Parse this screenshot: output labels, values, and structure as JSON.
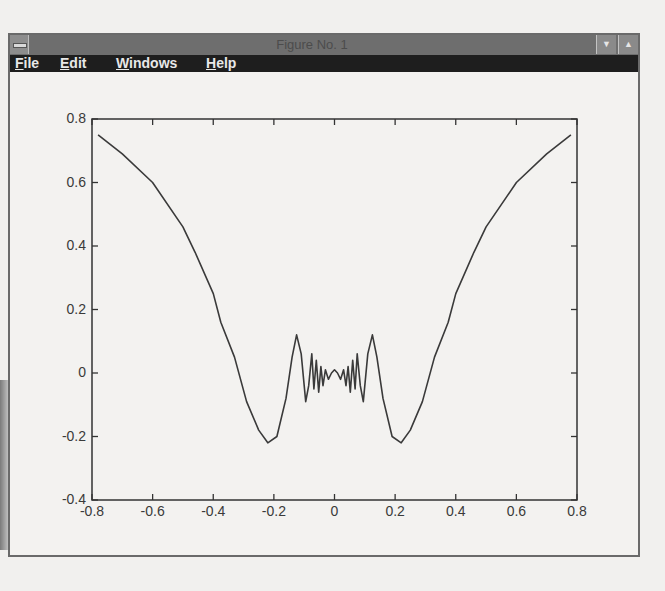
{
  "window": {
    "title": "Figure No. 1",
    "minimize_glyph": "▼",
    "maximize_glyph": "▲"
  },
  "menu": {
    "items": [
      {
        "label": "File",
        "mnemonic": "F",
        "rest": "ile"
      },
      {
        "label": "Edit",
        "mnemonic": "E",
        "rest": "dit"
      },
      {
        "label": "Windows",
        "mnemonic": "W",
        "rest": "indows"
      },
      {
        "label": "Help",
        "mnemonic": "H",
        "rest": "elp"
      }
    ]
  },
  "colors": {
    "line": "#3a3a3a",
    "axes": "#333333",
    "titlebar": "#6e6e6e",
    "menubar": "#1e1e1e"
  },
  "chart_data": {
    "type": "line",
    "title": "",
    "xlabel": "",
    "ylabel": "",
    "xlim": [
      -0.8,
      0.8
    ],
    "ylim": [
      -0.4,
      0.8
    ],
    "grid": false,
    "legend": null,
    "x_ticks": [
      "-0.8",
      "-0.6",
      "-0.4",
      "-0.2",
      "0",
      "0.2",
      "0.4",
      "0.6",
      "0.8"
    ],
    "y_ticks": [
      "-0.4",
      "-0.2",
      "0",
      "0.2",
      "0.4",
      "0.6",
      "0.8"
    ],
    "series": [
      {
        "name": "y",
        "x": [
          -0.78,
          -0.7,
          -0.6,
          -0.5,
          -0.46,
          -0.4,
          -0.375,
          -0.33,
          -0.29,
          -0.25,
          -0.22,
          -0.19,
          -0.16,
          -0.14,
          -0.125,
          -0.11,
          -0.095,
          -0.085,
          -0.075,
          -0.068,
          -0.06,
          -0.052,
          -0.045,
          -0.038,
          -0.03,
          -0.02,
          -0.01,
          0.0,
          0.01,
          0.02,
          0.03,
          0.038,
          0.045,
          0.052,
          0.06,
          0.068,
          0.075,
          0.085,
          0.095,
          0.11,
          0.125,
          0.14,
          0.16,
          0.19,
          0.22,
          0.25,
          0.29,
          0.33,
          0.375,
          0.4,
          0.46,
          0.5,
          0.6,
          0.7,
          0.78
        ],
        "values": [
          0.75,
          0.69,
          0.6,
          0.46,
          0.38,
          0.25,
          0.16,
          0.05,
          -0.09,
          -0.18,
          -0.22,
          -0.2,
          -0.08,
          0.05,
          0.12,
          0.06,
          -0.09,
          -0.04,
          0.06,
          -0.05,
          0.04,
          -0.06,
          0.02,
          -0.04,
          0.01,
          -0.02,
          0.0,
          0.01,
          0.0,
          -0.02,
          0.01,
          -0.04,
          0.02,
          -0.06,
          0.04,
          -0.05,
          0.06,
          -0.04,
          -0.09,
          0.06,
          0.12,
          0.05,
          -0.08,
          -0.2,
          -0.22,
          -0.18,
          -0.09,
          0.05,
          0.16,
          0.25,
          0.38,
          0.46,
          0.6,
          0.69,
          0.75
        ]
      }
    ]
  }
}
